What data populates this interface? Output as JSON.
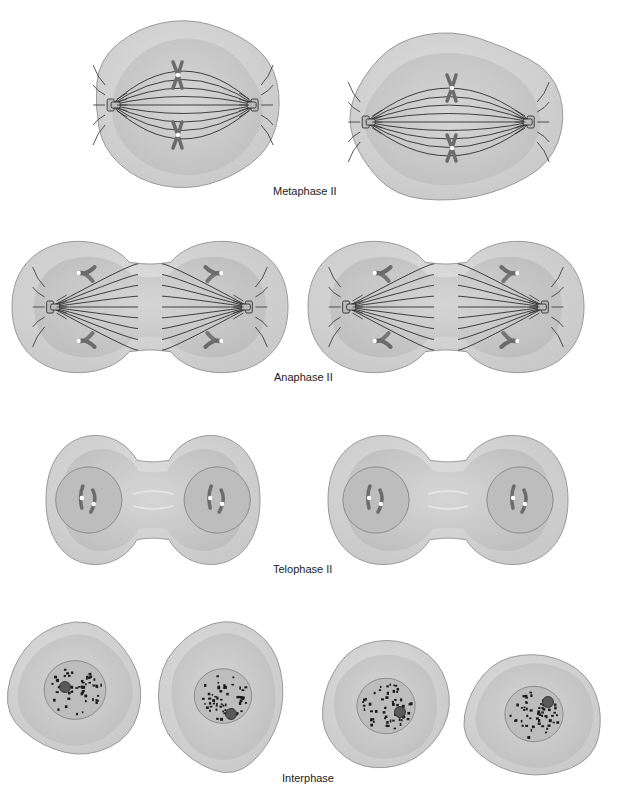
{
  "colors": {
    "background": "#ffffff",
    "cell_outer": "#c9c9c9",
    "cell_outer_stroke": "#9a9a9a",
    "cell_inner": "#b4b4b4",
    "cell_highlight": "#e6e6e6",
    "spindle": "#2e2e2e",
    "chromosome": "#6b6b6b",
    "centromere": "#ffffff",
    "nucleus": "#bdbdbd",
    "nucleus_stroke": "#8c8c8c",
    "chromatin": "#1a1a1a",
    "nucleolus": "#5a5a5a",
    "label_text": "#222222"
  },
  "stages": [
    {
      "id": "metaphase-ii",
      "label": "Metaphase II",
      "label_pos": {
        "x": 273,
        "y": 191
      },
      "cells": [
        {
          "cx": 186,
          "cy": 105,
          "rx": 96,
          "ry": 88,
          "shape": "metaphase"
        },
        {
          "cx": 452,
          "cy": 118,
          "rx": 110,
          "ry": 88,
          "shape": "metaphase"
        }
      ]
    },
    {
      "id": "anaphase-ii",
      "label": "Anaphase II",
      "label_pos": {
        "x": 274,
        "y": 377
      },
      "cells": [
        {
          "cx": 150,
          "cy": 307,
          "w": 276,
          "h": 144,
          "shape": "anaphase"
        },
        {
          "cx": 446,
          "cy": 307,
          "w": 276,
          "h": 144,
          "shape": "anaphase"
        }
      ]
    },
    {
      "id": "telophase-ii",
      "label": "Telophase II",
      "label_pos": {
        "x": 273,
        "y": 569
      },
      "cells": [
        {
          "cx": 153,
          "cy": 500,
          "w": 214,
          "h": 144,
          "shape": "telophase"
        },
        {
          "cx": 448,
          "cy": 500,
          "w": 240,
          "h": 144,
          "shape": "telophase"
        }
      ]
    },
    {
      "id": "interphase",
      "label": "Interphase",
      "label_pos": {
        "x": 282,
        "y": 778
      },
      "cells": [
        {
          "cx": 75,
          "cy": 690,
          "rx": 72,
          "ry": 70,
          "nucleolus": [
            -10,
            -3
          ],
          "shape": "interphase"
        },
        {
          "cx": 223,
          "cy": 696,
          "rx": 65,
          "ry": 78,
          "nucleolus": [
            8,
            18
          ],
          "shape": "interphase"
        },
        {
          "cx": 386,
          "cy": 706,
          "rx": 66,
          "ry": 68,
          "nucleolus": [
            14,
            6
          ],
          "shape": "interphase"
        },
        {
          "cx": 534,
          "cy": 714,
          "rx": 74,
          "ry": 66,
          "nucleolus": [
            14,
            -12
          ],
          "shape": "interphase"
        }
      ]
    }
  ]
}
